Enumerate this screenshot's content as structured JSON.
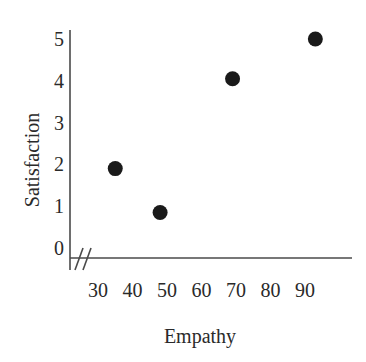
{
  "chart_data": {
    "type": "scatter",
    "title": "",
    "xlabel": "Empathy",
    "ylabel": "Satisfaction",
    "xticks": [
      30,
      40,
      50,
      60,
      70,
      80,
      90
    ],
    "yticks": [
      0,
      1,
      2,
      3,
      4,
      5
    ],
    "xlim": [
      25,
      97
    ],
    "ylim": [
      0,
      5.4
    ],
    "grid": false,
    "legend": null,
    "axis_break": "//",
    "axis_break_note": "x-axis break between origin and first tick",
    "marker": {
      "shape": "circle",
      "color": "#1a1a1a",
      "size_px": 15
    },
    "points": [
      {
        "x": 35,
        "y": 1.9,
        "label": "point-1"
      },
      {
        "x": 48,
        "y": 0.85,
        "label": "point-2"
      },
      {
        "x": 69,
        "y": 4.05,
        "label": "point-3"
      },
      {
        "x": 93,
        "y": 5.0,
        "label": "point-4"
      }
    ]
  },
  "axis": {
    "line_color": "#4a4a4a",
    "x_tick_labels": [
      "30",
      "40",
      "50",
      "60",
      "70",
      "80",
      "90"
    ],
    "y_tick_labels": [
      "0",
      "1",
      "2",
      "3",
      "4",
      "5"
    ],
    "x_title": "Empathy",
    "y_title": "Satisfaction",
    "break_glyph": "//"
  }
}
